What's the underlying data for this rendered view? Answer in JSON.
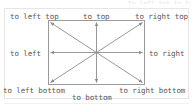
{
  "diagram": {
    "type": "direction-reference",
    "title_clipped": "to left top   to top",
    "center": {
      "x": 96.5,
      "y": 52.5
    },
    "box": {
      "left": 48,
      "top": 20,
      "width": 97,
      "height": 65
    },
    "colors": {
      "line": "#8c8c8c",
      "box_border": "#9b9b9b",
      "panel_border": "#e6e6e8",
      "text": "#585858",
      "background": "#ffffff"
    },
    "labels": {
      "left_top": "to left top",
      "top": "to top",
      "right_top": "to right top",
      "left": "to left",
      "right": "to right",
      "left_bottom": "to left bottom",
      "bottom": "to bottom",
      "right_bottom": "to right bottom"
    },
    "directions": [
      {
        "name": "to left top",
        "angle_deg": 135,
        "target": "top-left corner"
      },
      {
        "name": "to top",
        "angle_deg": 90,
        "target": "top edge midpoint"
      },
      {
        "name": "to right top",
        "angle_deg": 45,
        "target": "top-right corner"
      },
      {
        "name": "to left",
        "angle_deg": 180,
        "target": "left edge midpoint"
      },
      {
        "name": "to right",
        "angle_deg": 0,
        "target": "right edge midpoint"
      },
      {
        "name": "to left bottom",
        "angle_deg": 225,
        "target": "bottom-left corner"
      },
      {
        "name": "to bottom",
        "angle_deg": 270,
        "target": "bottom edge midpoint"
      },
      {
        "name": "to right bottom",
        "angle_deg": 315,
        "target": "bottom-right corner"
      }
    ]
  }
}
